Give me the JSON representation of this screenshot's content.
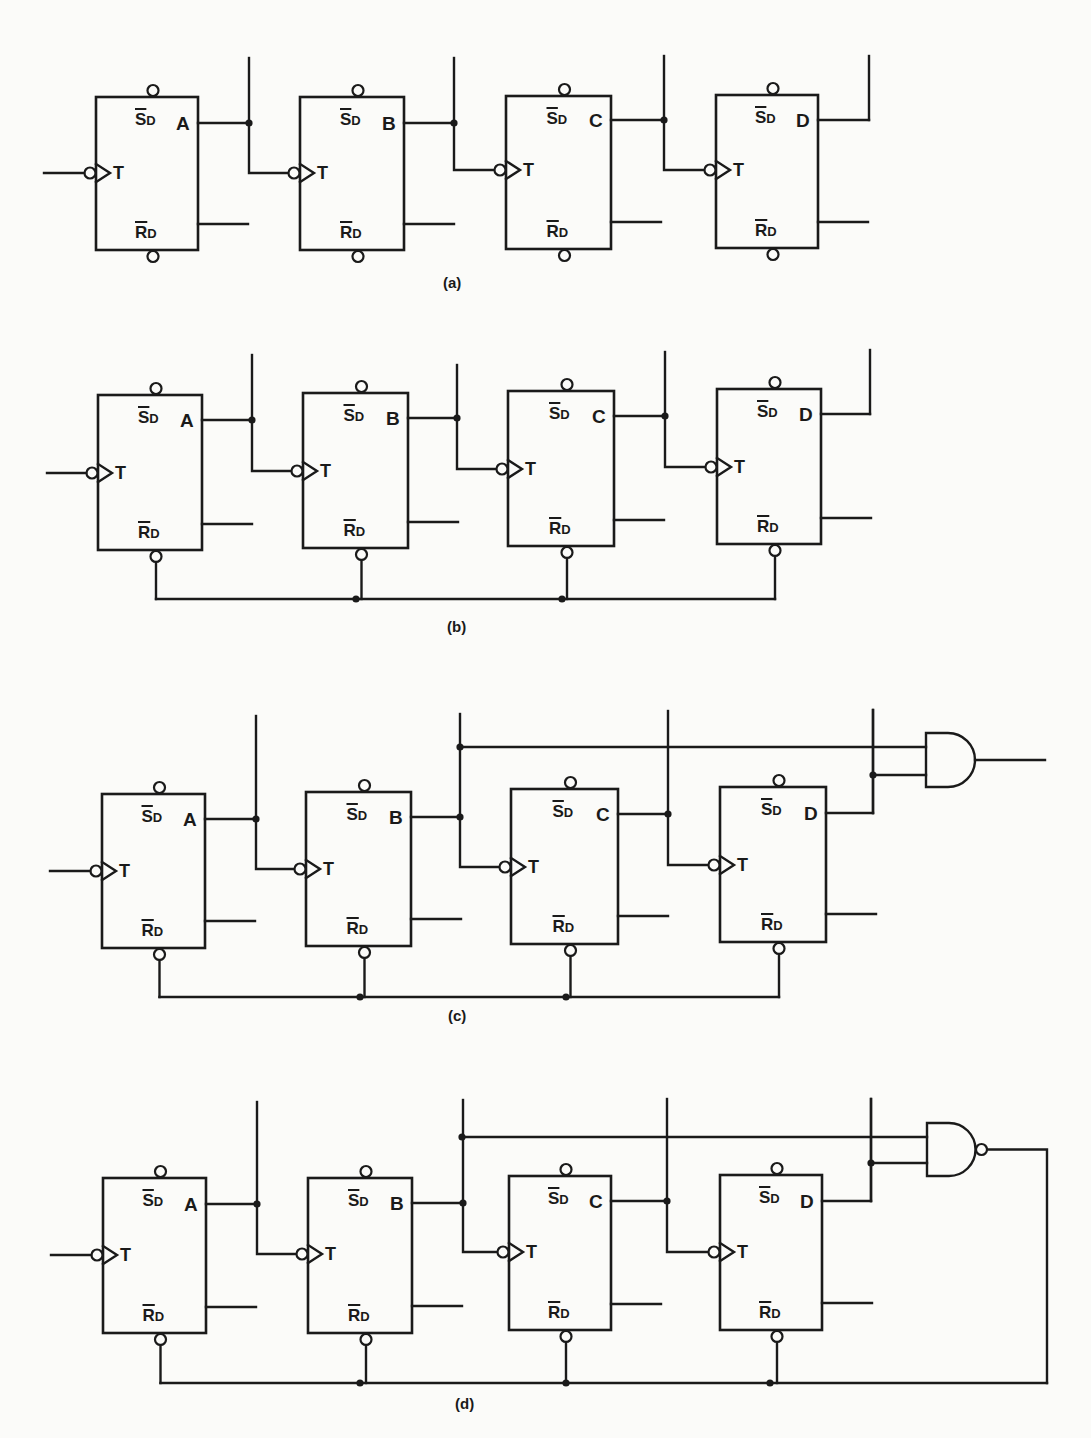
{
  "figure": {
    "background": "#fbfbf9",
    "ink": "#1a1a1a",
    "pin_labels": {
      "set": "S",
      "reset": "R",
      "subscript": "D",
      "toggle": "T"
    },
    "panels": [
      {
        "id": "a",
        "caption": "(a)",
        "caption_pos": [
          443,
          283
        ],
        "clock_input_x": 44,
        "reset_bus": null,
        "gate": null,
        "stages": [
          {
            "name": "A",
            "box": [
              96,
              97,
              198,
              250
            ],
            "q_y": 123,
            "t_y": 173,
            "qbar_y": 224,
            "q_tap_x": 249,
            "q_top_y": 58
          },
          {
            "name": "B",
            "box": [
              300,
              97,
              404,
              250
            ],
            "q_y": 123,
            "t_y": 173,
            "qbar_y": 224,
            "q_tap_x": 454,
            "q_top_y": 58
          },
          {
            "name": "C",
            "box": [
              506,
              96,
              611,
              249
            ],
            "q_y": 120,
            "t_y": 170,
            "qbar_y": 222,
            "q_tap_x": 664,
            "q_top_y": 56
          },
          {
            "name": "D",
            "box": [
              716,
              95,
              818,
              248
            ],
            "q_y": 120,
            "t_y": 170,
            "qbar_y": 222,
            "q_tap_x": 869,
            "q_top_y": 56
          }
        ]
      },
      {
        "id": "b",
        "caption": "(b)",
        "caption_pos": [
          447,
          627
        ],
        "clock_input_x": 47,
        "reset_bus": {
          "y": 599,
          "dots": [
            356,
            562
          ]
        },
        "gate": null,
        "stages": [
          {
            "name": "A",
            "box": [
              98,
              395,
              202,
              550
            ],
            "q_y": 420,
            "t_y": 473,
            "qbar_y": 524,
            "q_tap_x": 252,
            "q_top_y": 355
          },
          {
            "name": "B",
            "box": [
              303,
              393,
              408,
              548
            ],
            "q_y": 418,
            "t_y": 471,
            "qbar_y": 522,
            "q_tap_x": 457,
            "q_top_y": 365
          },
          {
            "name": "C",
            "box": [
              508,
              391,
              614,
              546
            ],
            "q_y": 416,
            "t_y": 469,
            "qbar_y": 520,
            "q_tap_x": 665,
            "q_top_y": 352
          },
          {
            "name": "D",
            "box": [
              717,
              389,
              821,
              544
            ],
            "q_y": 414,
            "t_y": 467,
            "qbar_y": 518,
            "q_tap_x": 870,
            "q_top_y": 350
          }
        ]
      },
      {
        "id": "c",
        "caption": "(c)",
        "caption_pos": [
          448,
          1016
        ],
        "clock_input_x": 50,
        "reset_bus": {
          "y": 997,
          "dots": [
            360,
            566
          ]
        },
        "gate": {
          "type": "AND",
          "x": 926,
          "top": 733,
          "bottom": 787,
          "in1_y": 747,
          "in2_y": 775,
          "out_x": 1045,
          "bubble": false,
          "in1_from_x": 460,
          "in1_tap": [
            460,
            751
          ],
          "in2_from_x": 873
        },
        "stages": [
          {
            "name": "A",
            "box": [
              102,
              794,
              205,
              948
            ],
            "q_y": 819,
            "t_y": 871,
            "qbar_y": 921,
            "q_tap_x": 256,
            "q_top_y": 716
          },
          {
            "name": "B",
            "box": [
              306,
              792,
              411,
              946
            ],
            "q_y": 817,
            "t_y": 869,
            "qbar_y": 919,
            "q_tap_x": 460,
            "q_top_y": 714
          },
          {
            "name": "C",
            "box": [
              511,
              789,
              618,
              944
            ],
            "q_y": 814,
            "t_y": 867,
            "qbar_y": 916,
            "q_tap_x": 668,
            "q_top_y": 711
          },
          {
            "name": "D",
            "box": [
              720,
              787,
              826,
              942
            ],
            "q_y": 813,
            "t_y": 865,
            "qbar_y": 914,
            "q_tap_x": 873,
            "q_top_y": 710
          }
        ]
      },
      {
        "id": "d",
        "caption": "(d)",
        "caption_pos": [
          455,
          1404
        ],
        "clock_input_x": 51,
        "reset_bus": {
          "y": 1383,
          "dots": [
            360,
            566,
            770
          ],
          "feedback_x": 1047
        },
        "gate": {
          "type": "NAND",
          "x": 927,
          "top": 1123,
          "bottom": 1176,
          "in1_y": 1137,
          "in2_y": 1163,
          "out_x": 1047,
          "bubble": true,
          "in1_from_x": 462,
          "in1_tap": [
            462,
            1138
          ],
          "in2_from_x": 871
        },
        "stages": [
          {
            "name": "A",
            "box": [
              103,
              1178,
              206,
              1333
            ],
            "q_y": 1204,
            "t_y": 1255,
            "qbar_y": 1307,
            "q_tap_x": 257,
            "q_top_y": 1102
          },
          {
            "name": "B",
            "box": [
              308,
              1178,
              412,
              1333
            ],
            "q_y": 1203,
            "t_y": 1254,
            "qbar_y": 1306,
            "q_tap_x": 463,
            "q_top_y": 1100
          },
          {
            "name": "C",
            "box": [
              509,
              1176,
              611,
              1330
            ],
            "q_y": 1201,
            "t_y": 1252,
            "qbar_y": 1304,
            "q_tap_x": 667,
            "q_top_y": 1099
          },
          {
            "name": "D",
            "box": [
              720,
              1175,
              822,
              1330
            ],
            "q_y": 1201,
            "t_y": 1252,
            "qbar_y": 1303,
            "q_tap_x": 871,
            "q_top_y": 1099
          }
        ]
      }
    ]
  }
}
